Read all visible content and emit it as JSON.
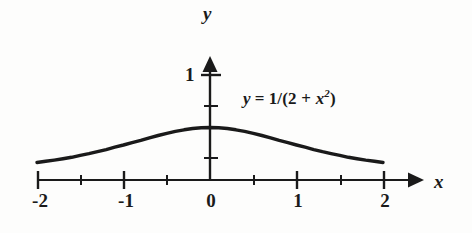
{
  "figure": {
    "background_color": "#fdfdfc",
    "ink_color": "#1a1a1a"
  },
  "axis_names": {
    "x": "x",
    "y": "y"
  },
  "equation": {
    "lhs": "y",
    "equals": "=",
    "rhs_prefix": "1/(2 + ",
    "rhs_base": "x",
    "rhs_exponent": "2",
    "rhs_suffix": ")",
    "full_text": "y = 1/(2 + x2)"
  },
  "x_tick_labels": [
    "-2",
    "-1",
    "0",
    "1",
    "2"
  ],
  "y_tick_labels": [
    "1"
  ],
  "chart_data": {
    "type": "line",
    "title": "",
    "subtitle": "",
    "xlabel": "x",
    "ylabel": "y",
    "xlim": [
      -2,
      2
    ],
    "ylim": [
      0,
      1.15
    ],
    "grid": false,
    "legend_position": "none",
    "annotations": [
      {
        "text": "y = 1/(2 + x^2)",
        "x": 0.55,
        "y": 0.84
      }
    ],
    "x_major_ticks": [
      -2,
      -1,
      0,
      1,
      2
    ],
    "x_minor_ticks": [
      -1.5,
      -0.5,
      0.5,
      1.5
    ],
    "y_major_ticks": [
      1
    ],
    "y_minor_ticks": [
      0.25,
      0.5,
      0.75
    ],
    "x_tick_labels": [
      "-2",
      "-1",
      "0",
      "1",
      "2"
    ],
    "y_tick_labels": [
      "1"
    ],
    "series": [
      {
        "name": "y = 1/(2 + x^2)",
        "formula": "1/(2 + x*x)",
        "color": "#1a1a1a",
        "linewidth": 3,
        "x": [
          -2.0,
          -1.9,
          -1.8,
          -1.7,
          -1.6,
          -1.5,
          -1.4,
          -1.3,
          -1.2,
          -1.1,
          -1.0,
          -0.9,
          -0.8,
          -0.7,
          -0.6,
          -0.5,
          -0.4,
          -0.3,
          -0.2,
          -0.1,
          0.0,
          0.1,
          0.2,
          0.3,
          0.4,
          0.5,
          0.6,
          0.7,
          0.8,
          0.9,
          1.0,
          1.1,
          1.2,
          1.3,
          1.4,
          1.5,
          1.6,
          1.7,
          1.8,
          1.9,
          2.0
        ],
        "values": [
          0.1667,
          0.1779,
          0.1898,
          0.2025,
          0.2161,
          0.2353,
          0.2513,
          0.2695,
          0.2899,
          0.3125,
          0.3333,
          0.3559,
          0.3774,
          0.4016,
          0.4237,
          0.4444,
          0.463,
          0.4785,
          0.4902,
          0.4975,
          0.5,
          0.4975,
          0.4902,
          0.4785,
          0.463,
          0.4444,
          0.4237,
          0.4016,
          0.3774,
          0.3559,
          0.3333,
          0.3125,
          0.2899,
          0.2695,
          0.2513,
          0.2353,
          0.2161,
          0.2025,
          0.1898,
          0.1779,
          0.1667
        ]
      }
    ]
  }
}
